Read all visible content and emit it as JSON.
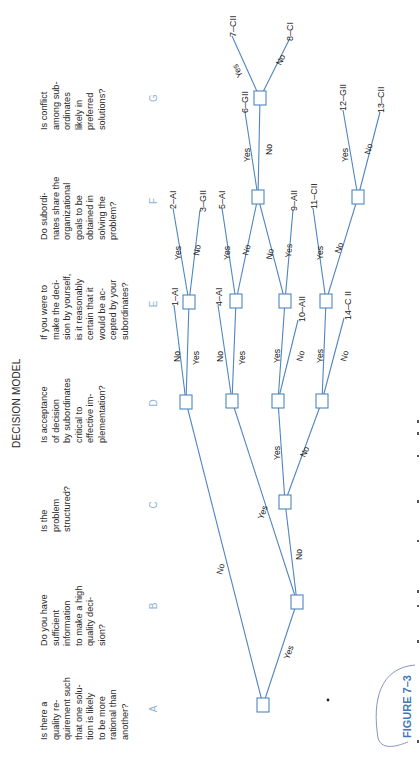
{
  "title": "DECISION MODEL",
  "figure_label": "FIGURE 7–3",
  "colors": {
    "line": "#4f86bf",
    "column_letter": "#8fb3d6",
    "figure_label": "#3f78b8",
    "text": "#2a2a2a"
  },
  "columns": [
    {
      "letter": "A",
      "question": [
        "Is there a",
        "quality re-",
        "quirement such",
        "that one solu-",
        "tion is likely",
        "to be more",
        "rational than",
        "another?"
      ]
    },
    {
      "letter": "B",
      "question": [
        "Do you have",
        "sufficient",
        "information",
        "to make a high",
        "quality deci-",
        "sion?"
      ]
    },
    {
      "letter": "C",
      "question": [
        "Is the",
        "problem",
        "structured?"
      ]
    },
    {
      "letter": "D",
      "question": [
        "Is acceptance",
        "of decision",
        "by subordinates",
        "critical to",
        "effective im-",
        "plementation?"
      ]
    },
    {
      "letter": "E",
      "question": [
        "If you were to",
        "make the deci-",
        "sion by yourself,",
        "is it reasonably",
        "certain that it",
        "would be ac-",
        "cepted by your",
        "subordinates?"
      ]
    },
    {
      "letter": "F",
      "question": [
        "Do subordi-",
        "nates share the",
        "organizational",
        "goals to be",
        "obtained in",
        "solving the",
        "problem?"
      ]
    },
    {
      "letter": "G",
      "question": [
        "Is conflict",
        "among sub-",
        "ordinates",
        "likely in",
        "preferred",
        "solutions?"
      ]
    }
  ],
  "branch_labels": {
    "yes": "Yes",
    "no": "No"
  },
  "outcomes": [
    "1–AI",
    "2–AI",
    "3–GII",
    "4–AI",
    "5–AI",
    "6–GII",
    "7–CII",
    "8–CI",
    "9–AII",
    "10–AII",
    "11–CII",
    "12–GII",
    "13–CII",
    "14–C II"
  ]
}
